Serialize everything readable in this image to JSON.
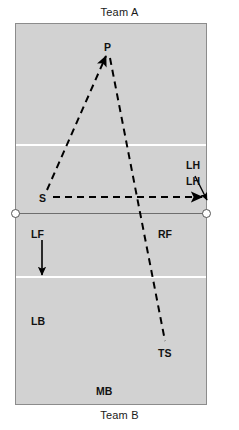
{
  "diagram": {
    "title_top": "Team A",
    "title_bottom": "Team B",
    "type": "volleyball-court-rotation-diagram",
    "court": {
      "fill_color": "#d2d2d2",
      "border_color": "#8c8c8c",
      "attack_line_color": "#ffffff",
      "net_line_color": "#6e6e6e"
    },
    "labels": {
      "p": "P",
      "s": "S",
      "lh_upper": "LH",
      "lh_lower": "LH",
      "lf": "LF",
      "rf": "RF",
      "lb": "LB",
      "mb": "MB",
      "ts": "TS"
    },
    "arrows": [
      {
        "name": "s-to-p-dashed",
        "from": "S",
        "to": "P",
        "style": "dashed",
        "arrowhead": true
      },
      {
        "name": "p-to-ts-dashed",
        "from": "P",
        "to": "TS",
        "style": "dashed",
        "arrowhead": false
      },
      {
        "name": "s-to-lh-dashed",
        "from": "S",
        "to": "LH",
        "style": "dashed",
        "arrowhead": true
      },
      {
        "name": "lh-callout",
        "from": "LH",
        "to": "court-right-sideline",
        "style": "solid",
        "arrowhead": true
      },
      {
        "name": "lf-down",
        "from": "LF",
        "to": "attack-line-bottom",
        "style": "solid",
        "arrowhead": true
      }
    ],
    "stroke_color": "#000000"
  }
}
